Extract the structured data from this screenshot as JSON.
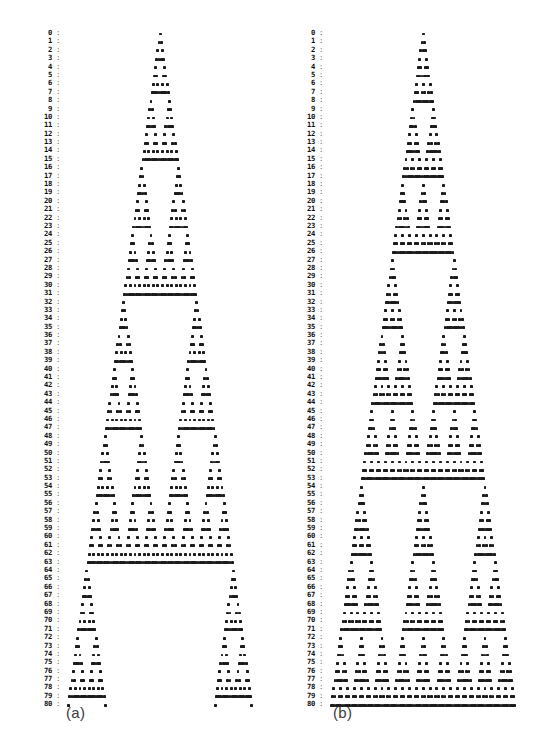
{
  "figure": {
    "background_color": "#ffffff",
    "dot_color": "#1b1b1b",
    "label_color": "#111111",
    "row_count": 81,
    "row_index_start": 0,
    "row_index_end": 80,
    "separator": ":"
  },
  "panels": [
    {
      "id": "a",
      "caption": "(a)",
      "columns": 81,
      "cell_pitch_px": 2.29,
      "description": "Pascal's triangle modulo 2 — Sierpinski gasket, rows 0 to 80"
    },
    {
      "id": "b",
      "caption": "(b)",
      "columns": 104,
      "cell_pitch_px": 2.29,
      "description": "Pascal's triangle modulo 3 nonzero-entry pattern, rows 0 to 80"
    }
  ],
  "row_labels": [
    "0",
    "1",
    "2",
    "3",
    "4",
    "5",
    "6",
    "7",
    "8",
    "9",
    "10",
    "11",
    "12",
    "13",
    "14",
    "15",
    "16",
    "17",
    "18",
    "19",
    "20",
    "21",
    "22",
    "23",
    "24",
    "25",
    "26",
    "27",
    "28",
    "29",
    "30",
    "31",
    "32",
    "33",
    "34",
    "35",
    "36",
    "37",
    "38",
    "39",
    "40",
    "41",
    "42",
    "43",
    "44",
    "45",
    "46",
    "47",
    "48",
    "49",
    "50",
    "51",
    "52",
    "53",
    "54",
    "55",
    "56",
    "57",
    "58",
    "59",
    "60",
    "61",
    "62",
    "63",
    "64",
    "65",
    "66",
    "67",
    "68",
    "69",
    "70",
    "71",
    "72",
    "73",
    "74",
    "75",
    "76",
    "77",
    "78",
    "79",
    "80"
  ],
  "chart_data": {
    "type": "scatter",
    "title": "",
    "subtitle": "",
    "xlabel": "",
    "ylabel": "",
    "grid": false,
    "legend": "none",
    "panel_a": {
      "name": "(a)",
      "rule": "binomial(n,k) mod 2 != 0",
      "modulus": 2,
      "rows": 81,
      "row_range": [
        0,
        80
      ],
      "k_range": [
        0,
        80
      ],
      "x_centered": true,
      "marker": "square-dot"
    },
    "panel_b": {
      "name": "(b)",
      "rule": "binomial(n,k) mod 3 != 0",
      "modulus": 3,
      "rows": 81,
      "row_range": [
        0,
        80
      ],
      "k_range": [
        0,
        80
      ],
      "x_centered": true,
      "marker": "square-dot"
    }
  }
}
